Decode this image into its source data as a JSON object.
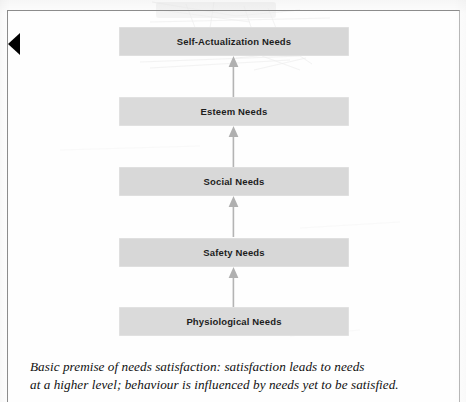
{
  "figure": {
    "kind": "hierarchy-diagram",
    "edge_marker_icon": "left-triangle-marker-icon",
    "arrow_icon": "up-arrow-icon",
    "colors": {
      "bar_fill": "#d8d8d8",
      "bar_text": "#1d1d1d",
      "arrow": "#b0b0b0",
      "frame_border": "#8d8d8d",
      "page_background": "#fefefe"
    },
    "levels": [
      {
        "label": "Self-Actualization Needs",
        "rank": 5
      },
      {
        "label": "Esteem Needs",
        "rank": 4
      },
      {
        "label": "Social Needs",
        "rank": 3
      },
      {
        "label": "Safety Needs",
        "rank": 2
      },
      {
        "label": "Physiological Needs",
        "rank": 1
      }
    ],
    "arrows": [
      {
        "from": "Esteem Needs",
        "to": "Self-Actualization Needs",
        "direction": "up"
      },
      {
        "from": "Social Needs",
        "to": "Esteem Needs",
        "direction": "up"
      },
      {
        "from": "Safety Needs",
        "to": "Social Needs",
        "direction": "up"
      },
      {
        "from": "Physiological Needs",
        "to": "Safety Needs",
        "direction": "up"
      }
    ],
    "caption": {
      "line_1": "Basic premise of needs satisfaction: satisfaction leads to needs",
      "line_2": "at a higher level; behaviour is influenced by needs yet to be satisfied."
    }
  }
}
